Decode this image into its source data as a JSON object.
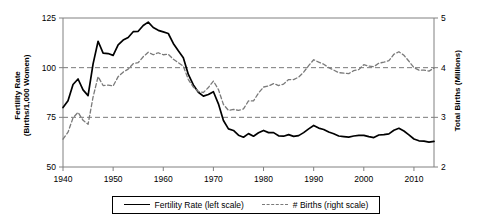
{
  "chart_data": {
    "type": "line",
    "title": "",
    "xlabel": "",
    "ylabel": "Fertility Rate (Births/1,000 Women)",
    "y2label": "Total Births (Millions)",
    "xlim": [
      1940,
      2014
    ],
    "ylim": [
      50,
      125
    ],
    "y2lim": [
      2,
      5
    ],
    "grid": true,
    "grid_lines_left": [
      75,
      100
    ],
    "legend_position": "bottom",
    "xticks": [
      1940,
      1950,
      1960,
      1970,
      1980,
      1990,
      2000,
      2010
    ],
    "yticks": [
      50,
      75,
      100,
      125
    ],
    "y2ticks": [
      2,
      3,
      4,
      5
    ],
    "x": [
      1940,
      1941,
      1942,
      1943,
      1944,
      1945,
      1946,
      1947,
      1948,
      1949,
      1950,
      1951,
      1952,
      1953,
      1954,
      1955,
      1956,
      1957,
      1958,
      1959,
      1960,
      1961,
      1962,
      1963,
      1964,
      1965,
      1966,
      1967,
      1968,
      1969,
      1970,
      1971,
      1972,
      1973,
      1974,
      1975,
      1976,
      1977,
      1978,
      1979,
      1980,
      1981,
      1982,
      1983,
      1984,
      1985,
      1986,
      1987,
      1988,
      1989,
      1990,
      1991,
      1992,
      1993,
      1994,
      1995,
      1996,
      1997,
      1998,
      1999,
      2000,
      2001,
      2002,
      2003,
      2004,
      2005,
      2006,
      2007,
      2008,
      2009,
      2010,
      2011,
      2012,
      2013,
      2014
    ],
    "series": [
      {
        "name": "Fertility Rate (left scale)",
        "axis": "left",
        "style": "solid",
        "color": "#000000",
        "units": "births per 1,000 women",
        "values": [
          79.9,
          83.4,
          91.5,
          94.3,
          88.8,
          85.9,
          101.9,
          113.3,
          107.3,
          107.1,
          106.2,
          111.5,
          113.9,
          115.2,
          118.1,
          118.3,
          121.2,
          122.9,
          120.2,
          118.8,
          118.0,
          117.2,
          112.2,
          108.5,
          105.0,
          96.6,
          91.3,
          87.6,
          85.7,
          86.5,
          87.9,
          81.8,
          73.4,
          69.2,
          68.4,
          66.0,
          65.0,
          66.8,
          65.5,
          67.2,
          68.4,
          67.3,
          67.3,
          65.7,
          65.5,
          66.3,
          65.4,
          65.8,
          67.3,
          69.2,
          70.9,
          69.6,
          68.9,
          67.6,
          66.7,
          65.6,
          65.3,
          65.0,
          65.6,
          65.9,
          65.9,
          65.3,
          64.8,
          66.1,
          66.3,
          66.7,
          68.5,
          69.5,
          68.1,
          66.2,
          64.1,
          63.2,
          63.0,
          62.5,
          62.9
        ]
      },
      {
        "name": "# Births (right scale)",
        "axis": "right",
        "style": "dashed",
        "color": "#7a7a7a",
        "units": "millions",
        "values": [
          2.56,
          2.7,
          2.99,
          3.1,
          2.94,
          2.86,
          3.41,
          3.82,
          3.64,
          3.65,
          3.63,
          3.82,
          3.91,
          3.97,
          4.08,
          4.1,
          4.22,
          4.31,
          4.26,
          4.3,
          4.26,
          4.27,
          4.17,
          4.1,
          4.03,
          3.76,
          3.61,
          3.52,
          3.5,
          3.6,
          3.73,
          3.56,
          3.26,
          3.14,
          3.16,
          3.14,
          3.17,
          3.33,
          3.33,
          3.49,
          3.61,
          3.63,
          3.68,
          3.64,
          3.67,
          3.76,
          3.76,
          3.81,
          3.91,
          4.04,
          4.16,
          4.11,
          4.07,
          4.0,
          3.95,
          3.9,
          3.89,
          3.88,
          3.94,
          3.96,
          4.06,
          4.03,
          4.02,
          4.09,
          4.11,
          4.14,
          4.27,
          4.32,
          4.25,
          4.13,
          4.0,
          3.95,
          3.95,
          3.93,
          3.99
        ]
      }
    ]
  },
  "legend": {
    "entries": [
      {
        "label": "Fertility Rate (left scale)",
        "style": "solid"
      },
      {
        "label": "# Births (right scale)",
        "style": "dashed"
      }
    ]
  },
  "axis_titles": {
    "left_line1": "Fertility Rate",
    "left_line2": "(Births/1,000 Women)",
    "right": "Total Births (Millions)"
  }
}
